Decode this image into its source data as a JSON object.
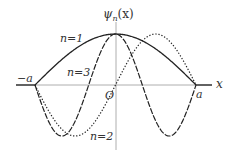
{
  "figure": {
    "y_axis_label": "ψ",
    "y_axis_sub": "n",
    "y_axis_arg": "(x)",
    "x_axis_label": "x",
    "origin_label": "O",
    "left_bound_label": "−a",
    "right_bound_label": "a",
    "colors": {
      "curve": "#222222",
      "axis": "#999999",
      "text": "#333333"
    },
    "curves": [
      {
        "label": "n=1",
        "n": 1,
        "style": "solid"
      },
      {
        "label": "n=2",
        "n": 2,
        "style": "dotted"
      },
      {
        "label": "n=3",
        "n": 3,
        "style": "dashed"
      }
    ]
  }
}
